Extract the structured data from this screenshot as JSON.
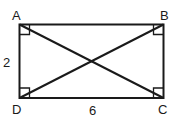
{
  "diagram": {
    "type": "rectangle with diagonals",
    "vertices": {
      "A": {
        "label": "A",
        "x": 19.5,
        "y": 24.5
      },
      "B": {
        "label": "B",
        "x": 163.5,
        "y": 24.5
      },
      "C": {
        "label": "C",
        "x": 163.5,
        "y": 98
      },
      "D": {
        "label": "D",
        "x": 19.5,
        "y": 98
      }
    },
    "side_labels": {
      "AD": "2",
      "DC": "6"
    },
    "right_angle_markers": [
      "A",
      "B",
      "C",
      "D"
    ],
    "stroke_color": "#1a1a1a"
  }
}
